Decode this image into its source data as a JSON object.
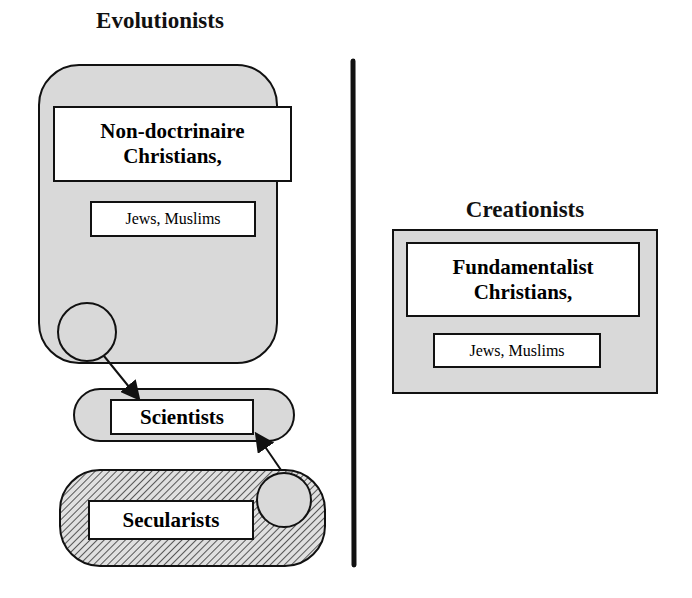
{
  "diagram": {
    "left_group": {
      "title": "Evolutionists",
      "main_box": "Non-doctrinaire Christians,",
      "main_box_line1": "Non-doctrinaire",
      "main_box_line2": "Christians,",
      "sub_box": "Jews, Muslims"
    },
    "scientists": {
      "label": "Scientists"
    },
    "secularists": {
      "label": "Secularists"
    },
    "right_group": {
      "title": "Creationists",
      "main_box": "Fundamentalist Christians,",
      "main_box_line1": "Fundamentalist",
      "main_box_line2": "Christians,",
      "sub_box": "Jews, Muslims"
    },
    "arrows": [
      {
        "from": "Evolutionists",
        "to": "Scientists"
      },
      {
        "from": "Secularists",
        "to": "Scientists"
      }
    ],
    "colors": {
      "fill_gray": "#d9d9d9",
      "stroke": "#111111",
      "background": "#ffffff"
    }
  }
}
